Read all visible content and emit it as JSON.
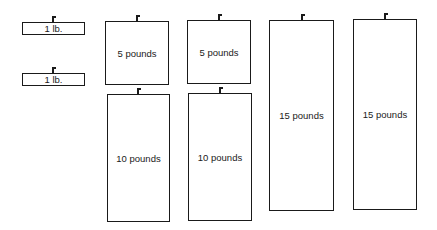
{
  "diagram": {
    "weights": [
      {
        "id": "w1a",
        "label": "1 lb.",
        "x": 22,
        "y": 22,
        "w": 63,
        "h": 13,
        "hook_x": 52
      },
      {
        "id": "w1b",
        "label": "1 lb.",
        "x": 22,
        "y": 73,
        "w": 63,
        "h": 13,
        "hook_x": 52
      },
      {
        "id": "w5a",
        "label": "5 pounds",
        "x": 105,
        "y": 21,
        "w": 64,
        "h": 64,
        "hook_x": 136
      },
      {
        "id": "w10a",
        "label": "10 pounds",
        "x": 107,
        "y": 94,
        "w": 63,
        "h": 128,
        "hook_x": 137
      },
      {
        "id": "w5b",
        "label": "5 pounds",
        "x": 187,
        "y": 20,
        "w": 64,
        "h": 64,
        "hook_x": 218
      },
      {
        "id": "w10b",
        "label": "10 pounds",
        "x": 188,
        "y": 93,
        "w": 64,
        "h": 128,
        "hook_x": 219
      },
      {
        "id": "w15a",
        "label": "15 pounds",
        "x": 269,
        "y": 20,
        "w": 65,
        "h": 191,
        "hook_x": 301
      },
      {
        "id": "w15b",
        "label": "15 pounds",
        "x": 353,
        "y": 19,
        "w": 64,
        "h": 191,
        "hook_x": 384
      }
    ]
  }
}
